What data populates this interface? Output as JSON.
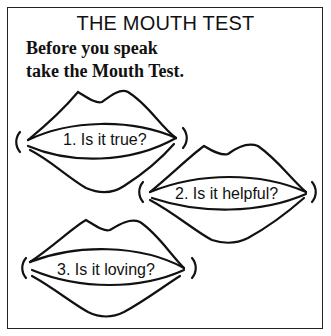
{
  "title": "THE MOUTH TEST",
  "subtitle": {
    "line1": "Before you speak",
    "line2": "take the Mouth Test."
  },
  "questions": [
    {
      "label": "1. Is it true?"
    },
    {
      "label": "2. Is it helpful?"
    },
    {
      "label": "3. Is it loving?"
    }
  ],
  "colors": {
    "ink": "#111111",
    "background": "#ffffff"
  }
}
